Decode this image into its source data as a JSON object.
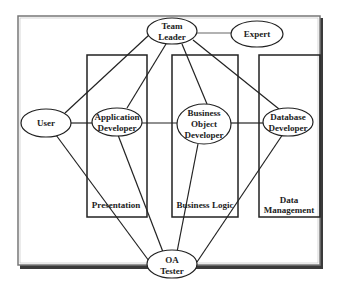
{
  "diagram": {
    "layers": [
      {
        "id": "presentation",
        "label": [
          "Presentation"
        ]
      },
      {
        "id": "business-logic",
        "label": [
          "Business Logic"
        ]
      },
      {
        "id": "data-management",
        "label": [
          "Data",
          "Management"
        ]
      }
    ],
    "nodes": [
      {
        "id": "team-leader",
        "label": [
          "Team",
          "Leader"
        ]
      },
      {
        "id": "expert",
        "label": [
          "Expert"
        ]
      },
      {
        "id": "user",
        "label": [
          "User"
        ]
      },
      {
        "id": "application-developer",
        "label": [
          "Application",
          "Developer"
        ]
      },
      {
        "id": "business-object-developer",
        "label": [
          "Business",
          "Object",
          "Developer"
        ]
      },
      {
        "id": "database-developer",
        "label": [
          "Database",
          "Developer"
        ]
      },
      {
        "id": "qa-tester",
        "label": [
          "OA",
          "Tester"
        ]
      }
    ],
    "edges": [
      [
        "team-leader",
        "expert"
      ],
      [
        "team-leader",
        "user"
      ],
      [
        "team-leader",
        "application-developer"
      ],
      [
        "team-leader",
        "business-object-developer"
      ],
      [
        "team-leader",
        "database-developer"
      ],
      [
        "user",
        "application-developer"
      ],
      [
        "application-developer",
        "business-object-developer"
      ],
      [
        "business-object-developer",
        "database-developer"
      ],
      [
        "user",
        "qa-tester"
      ],
      [
        "application-developer",
        "qa-tester"
      ],
      [
        "business-object-developer",
        "qa-tester"
      ],
      [
        "database-developer",
        "qa-tester"
      ]
    ]
  }
}
